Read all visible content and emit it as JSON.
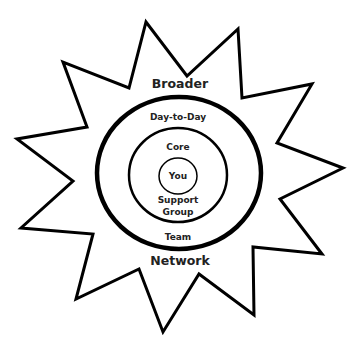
{
  "diagram": {
    "type": "concentric-circles-in-starburst",
    "labels": {
      "broader": "Broader",
      "network": "Network",
      "day_to_day": "Day-to-Day",
      "team": "Team",
      "core": "Core",
      "support_line1": "Support",
      "support_line2": "Group",
      "you": "You"
    },
    "colors": {
      "stroke": "#000000",
      "text": "#222222",
      "background": "#ffffff"
    }
  }
}
